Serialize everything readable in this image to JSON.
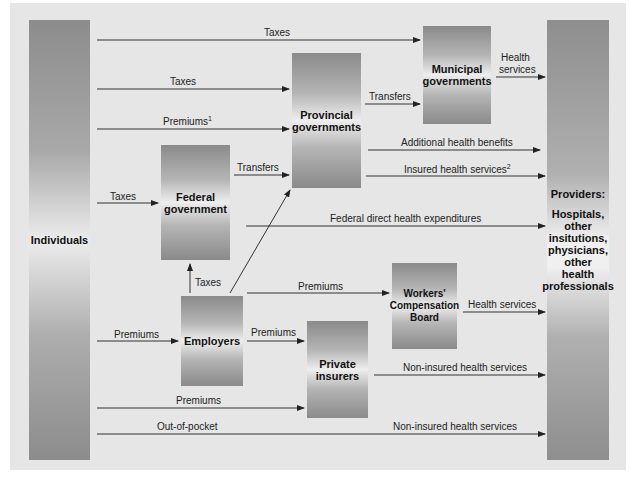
{
  "diagram": {
    "nodes": {
      "individuals": "Individuals",
      "federal": "Federal government",
      "federal_l1": "Federal",
      "federal_l2": "government",
      "provincial_l1": "Provincial",
      "provincial_l2": "governments",
      "municipal_l1": "Municipal",
      "municipal_l2": "governments",
      "employers": "Employers",
      "wcb_l1": "Workers'",
      "wcb_l2": "Compensation",
      "wcb_l3": "Board",
      "private_l1": "Private",
      "private_l2": "insurers",
      "providers_title": "Providers:",
      "providers_l1": "Hospitals,",
      "providers_l2": "other",
      "providers_l3": "insitutions,",
      "providers_l4": "physicians,",
      "providers_l5": "other",
      "providers_l6": "health",
      "providers_l7": "professionals"
    },
    "edges": {
      "ind_to_muni": "Taxes",
      "ind_to_prov_taxes": "Taxes",
      "ind_to_prov_premiums": "Premiums",
      "ind_to_prov_premiums_note": "1",
      "ind_to_fed": "Taxes",
      "fed_to_prov": "Transfers",
      "prov_to_muni": "Transfers",
      "muni_to_providers_l1": "Health",
      "muni_to_providers_l2": "services",
      "prov_additional": "Additional health benefits",
      "prov_insured": "Insured health services",
      "prov_insured_note": "2",
      "fed_direct": "Federal direct health expenditures",
      "emp_to_fed": "Taxes",
      "emp_to_wcb": "Premiums",
      "wcb_to_providers": "Health services",
      "ind_to_emp": "Premiums",
      "emp_to_private": "Premiums",
      "private_to_providers": "Non-insured health services",
      "ind_to_private": "Premiums",
      "ind_out_of_pocket": "Out-of-pocket",
      "out_of_pocket_to_providers": "Non-insured health services"
    },
    "colors": {
      "background": "#e6e6e6",
      "box_dark": "#8a8a8a",
      "box_light": "#eeeeee",
      "arrow": "#222222"
    }
  }
}
